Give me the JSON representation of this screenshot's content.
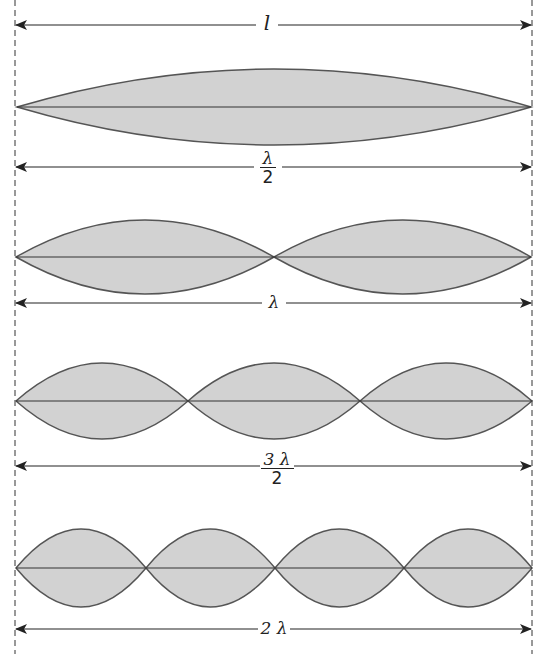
{
  "diagram": {
    "colors": {
      "fill": "#d2d2d2",
      "stroke": "#555555",
      "line": "#222222"
    },
    "top_dimension": {
      "label": "l"
    },
    "modes": [
      {
        "loops": 1,
        "label_num": "λ",
        "label_den": "2"
      },
      {
        "loops": 2,
        "label": "λ"
      },
      {
        "loops": 3,
        "label_num": "3 λ",
        "label_den": "2"
      },
      {
        "loops": 4,
        "label": "2 λ"
      }
    ]
  }
}
